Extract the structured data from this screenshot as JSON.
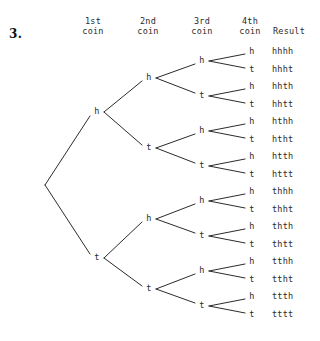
{
  "problem": {
    "number": "3."
  },
  "headers": [
    {
      "id": "col-1st-coin",
      "line1": "1st",
      "line2": "coin",
      "x": 93
    },
    {
      "id": "col-2nd-coin",
      "line1": "2nd",
      "line2": "coin",
      "x": 148
    },
    {
      "id": "col-3rd-coin",
      "line1": "3rd",
      "line2": "coin",
      "x": 202
    },
    {
      "id": "col-4th-coin",
      "line1": "4th",
      "line2": "coin",
      "x": 250
    },
    {
      "id": "col-result",
      "line1": "",
      "line2": "Result",
      "x": 289
    }
  ],
  "tree": {
    "root": {
      "x": 45,
      "y": 185
    },
    "line_color": "#2b2b2b",
    "line_width": 1,
    "level1": [
      {
        "label": "h",
        "x": 97,
        "y": 112
      },
      {
        "label": "t",
        "x": 97,
        "y": 258
      }
    ],
    "level2": [
      {
        "label": "h",
        "x": 149,
        "y": 78
      },
      {
        "label": "t",
        "x": 149,
        "y": 148
      },
      {
        "label": "h",
        "x": 149,
        "y": 219
      },
      {
        "label": "t",
        "x": 149,
        "y": 289
      }
    ],
    "level3": [
      {
        "label": "h",
        "x": 202,
        "y": 61
      },
      {
        "label": "t",
        "x": 202,
        "y": 96
      },
      {
        "label": "h",
        "x": 202,
        "y": 131
      },
      {
        "label": "t",
        "x": 202,
        "y": 166
      },
      {
        "label": "h",
        "x": 202,
        "y": 201
      },
      {
        "label": "t",
        "x": 202,
        "y": 236
      },
      {
        "label": "h",
        "x": 202,
        "y": 271
      },
      {
        "label": "t",
        "x": 202,
        "y": 306
      }
    ],
    "level4": [
      {
        "label": "h",
        "result": "hhhh",
        "x": 252,
        "y": 52
      },
      {
        "label": "t",
        "result": "hhht",
        "x": 252,
        "y": 70
      },
      {
        "label": "h",
        "result": "hhth",
        "x": 252,
        "y": 87
      },
      {
        "label": "t",
        "result": "hhtt",
        "x": 252,
        "y": 105
      },
      {
        "label": "h",
        "result": "hthh",
        "x": 252,
        "y": 122
      },
      {
        "label": "t",
        "result": "htht",
        "x": 252,
        "y": 140
      },
      {
        "label": "h",
        "result": "htth",
        "x": 252,
        "y": 157
      },
      {
        "label": "t",
        "result": "httt",
        "x": 252,
        "y": 175
      },
      {
        "label": "h",
        "result": "thhh",
        "x": 252,
        "y": 192
      },
      {
        "label": "t",
        "result": "thht",
        "x": 252,
        "y": 210
      },
      {
        "label": "h",
        "result": "thth",
        "x": 252,
        "y": 227
      },
      {
        "label": "t",
        "result": "thtt",
        "x": 252,
        "y": 245
      },
      {
        "label": "h",
        "result": "tthh",
        "x": 252,
        "y": 262
      },
      {
        "label": "t",
        "result": "ttht",
        "x": 252,
        "y": 280
      },
      {
        "label": "h",
        "result": "ttth",
        "x": 252,
        "y": 297
      },
      {
        "label": "t",
        "result": "tttt",
        "x": 252,
        "y": 315
      }
    ],
    "result_x": 272
  }
}
